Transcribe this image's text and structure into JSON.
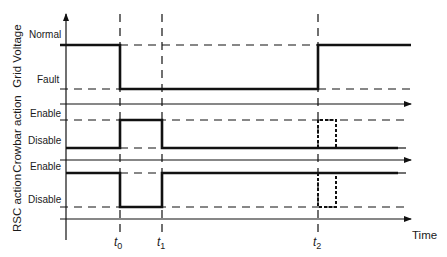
{
  "diagram": {
    "type": "timing-diagram",
    "panels": [
      {
        "id": "grid",
        "axis_label": "Grid Voltage",
        "levels": {
          "high": "Normal",
          "low": "Fault"
        }
      },
      {
        "id": "crowbar",
        "axis_label": "Crowbar action",
        "levels": {
          "high": "Enable",
          "low": "Disable"
        }
      },
      {
        "id": "rsc",
        "axis_label": "RSC action",
        "levels": {
          "high": "Enable",
          "low": "Disable"
        }
      }
    ],
    "time_marks": [
      {
        "base": "t",
        "sub": "0"
      },
      {
        "base": "t",
        "sub": "1"
      },
      {
        "base": "t",
        "sub": "2"
      }
    ],
    "x_axis_label": "Time",
    "colors": {
      "line": "#111111",
      "background": "#ffffff"
    }
  }
}
